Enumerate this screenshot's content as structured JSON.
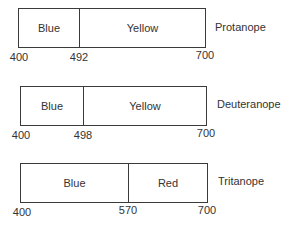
{
  "diagram": {
    "units": "nm",
    "scale": {
      "min": 400,
      "max": 700
    },
    "rows": [
      {
        "name": "Protanope",
        "segments": [
          {
            "label": "Blue",
            "start": 400,
            "end": 492
          },
          {
            "label": "Yellow",
            "start": 492,
            "end": 700
          }
        ],
        "ticks": [
          "400",
          "492",
          "700"
        ]
      },
      {
        "name": "Deuteranope",
        "segments": [
          {
            "label": "Blue",
            "start": 400,
            "end": 498
          },
          {
            "label": "Yellow",
            "start": 498,
            "end": 700
          }
        ],
        "ticks": [
          "400",
          "498",
          "700"
        ]
      },
      {
        "name": "Tritanope",
        "segments": [
          {
            "label": "Blue",
            "start": 400,
            "end": 570
          },
          {
            "label": "Red",
            "start": 570,
            "end": 700
          }
        ],
        "ticks": [
          "400",
          "570",
          "700"
        ]
      }
    ]
  }
}
